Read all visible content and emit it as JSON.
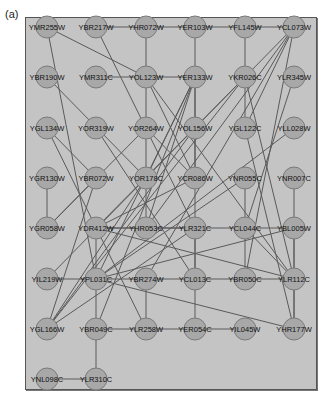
{
  "panel_label": "(a)",
  "colors": {
    "background": "#c4c4c4",
    "node_fill": "#a8a8a8",
    "edge": "#5a5a5a",
    "border": "#555555"
  },
  "grid": {
    "cols_x": [
      47,
      96,
      146,
      195,
      245,
      294
    ],
    "rows_y": [
      27,
      77,
      128,
      178,
      228,
      279,
      329,
      379
    ]
  },
  "nodes": [
    {
      "id": "YMR255W",
      "c": 0,
      "r": 0
    },
    {
      "id": "YBR217W",
      "c": 1,
      "r": 0
    },
    {
      "id": "YHR072W",
      "c": 2,
      "r": 0
    },
    {
      "id": "YER103W",
      "c": 3,
      "r": 0
    },
    {
      "id": "YFL145W",
      "c": 4,
      "r": 0
    },
    {
      "id": "YCL073W",
      "c": 5,
      "r": 0
    },
    {
      "id": "YBR190W",
      "c": 0,
      "r": 1
    },
    {
      "id": "YMR311C",
      "c": 1,
      "r": 1
    },
    {
      "id": "YOL123W",
      "c": 2,
      "r": 1
    },
    {
      "id": "YER133W",
      "c": 3,
      "r": 1
    },
    {
      "id": "YKR026C",
      "c": 4,
      "r": 1
    },
    {
      "id": "YLR345W",
      "c": 5,
      "r": 1
    },
    {
      "id": "YGL134W",
      "c": 0,
      "r": 2
    },
    {
      "id": "YOR319W",
      "c": 1,
      "r": 2
    },
    {
      "id": "YOR264W",
      "c": 2,
      "r": 2
    },
    {
      "id": "YOL156W",
      "c": 3,
      "r": 2
    },
    {
      "id": "YGL122C",
      "c": 4,
      "r": 2
    },
    {
      "id": "YLL028W",
      "c": 5,
      "r": 2
    },
    {
      "id": "YGR130W",
      "c": 0,
      "r": 3
    },
    {
      "id": "YBR072W",
      "c": 1,
      "r": 3
    },
    {
      "id": "YOR178C",
      "c": 2,
      "r": 3
    },
    {
      "id": "YCR086W",
      "c": 3,
      "r": 3
    },
    {
      "id": "YNR055C",
      "c": 4,
      "r": 3
    },
    {
      "id": "YNR007C",
      "c": 5,
      "r": 3
    },
    {
      "id": "YGR058W",
      "c": 0,
      "r": 4
    },
    {
      "id": "YDR412W",
      "c": 1,
      "r": 4
    },
    {
      "id": "YHR053C",
      "c": 2,
      "r": 4
    },
    {
      "id": "YLR321C",
      "c": 3,
      "r": 4
    },
    {
      "id": "YCL044C",
      "c": 4,
      "r": 4
    },
    {
      "id": "YBL005W",
      "c": 5,
      "r": 4
    },
    {
      "id": "YIL219W",
      "c": 0,
      "r": 5
    },
    {
      "id": "YPL031C",
      "c": 1,
      "r": 5
    },
    {
      "id": "YBR274W",
      "c": 2,
      "r": 5
    },
    {
      "id": "YCL013C",
      "c": 3,
      "r": 5
    },
    {
      "id": "YBR050C",
      "c": 4,
      "r": 5
    },
    {
      "id": "YLR112C",
      "c": 5,
      "r": 5
    },
    {
      "id": "YGL166W",
      "c": 0,
      "r": 6
    },
    {
      "id": "YBR049C",
      "c": 1,
      "r": 6
    },
    {
      "id": "YLR258W",
      "c": 2,
      "r": 6
    },
    {
      "id": "YER054C",
      "c": 3,
      "r": 6
    },
    {
      "id": "YIL045W",
      "c": 4,
      "r": 6
    },
    {
      "id": "YHR177W",
      "c": 5,
      "r": 6
    },
    {
      "id": "YNL098C",
      "c": 0,
      "r": 7
    },
    {
      "id": "YLR310C",
      "c": 1,
      "r": 7
    }
  ],
  "edges": [
    [
      "YBR217W",
      "YHR072W"
    ],
    [
      "YHR072W",
      "YER103W"
    ],
    [
      "YER103W",
      "YFL145W"
    ],
    [
      "YFL145W",
      "YCL073W"
    ],
    [
      "YMR311C",
      "YOL123W"
    ],
    [
      "YOL123W",
      "YER133W"
    ],
    [
      "YMR255W",
      "YOL123W"
    ],
    [
      "YMR255W",
      "YPL031C"
    ],
    [
      "YBR217W",
      "YLR321C"
    ],
    [
      "YHR072W",
      "YHR053C"
    ],
    [
      "YER103W",
      "YOL156W"
    ],
    [
      "YFL145W",
      "YGL122C"
    ],
    [
      "YCL073W",
      "YOL156W"
    ],
    [
      "YCL073W",
      "YHR053C"
    ],
    [
      "YCL073W",
      "YBR274W"
    ],
    [
      "YCL073W",
      "YGL122C"
    ],
    [
      "YCL073W",
      "YBR050C"
    ],
    [
      "YBR190W",
      "YOR178C"
    ],
    [
      "YOL123W",
      "YLR112C"
    ],
    [
      "YOL123W",
      "YCR086W"
    ],
    [
      "YER133W",
      "YOR178C"
    ],
    [
      "YER133W",
      "YPL031C"
    ],
    [
      "YER133W",
      "YBR049C"
    ],
    [
      "YER133W",
      "YHR053C"
    ],
    [
      "YER133W",
      "YCL013C"
    ],
    [
      "YKR026C",
      "YLR112C"
    ],
    [
      "YKR026C",
      "YDR412W"
    ],
    [
      "YKR026C",
      "YGL166W"
    ],
    [
      "YLR345W",
      "YCL044C"
    ],
    [
      "YGL134W",
      "YLR258W"
    ],
    [
      "YOR319W",
      "YCL013C"
    ],
    [
      "YOR264W",
      "YGR058W"
    ],
    [
      "YOR264W",
      "YCR086W"
    ],
    [
      "YOL156W",
      "YOL156W"
    ],
    [
      "YOL156W",
      "YCR086W"
    ],
    [
      "YOL156W",
      "YGL166W"
    ],
    [
      "YOL156W",
      "YIL219W"
    ],
    [
      "YGL122C",
      "YHR177W"
    ],
    [
      "YLL028W",
      "YPL031C"
    ],
    [
      "YNR007C",
      "YBL005W"
    ],
    [
      "YGR130W",
      "YGR058W"
    ],
    [
      "YBR072W",
      "YGL166W"
    ],
    [
      "YBR072W",
      "YGL134W"
    ],
    [
      "YOR178C",
      "YGL166W"
    ],
    [
      "YCR086W",
      "YDR412W"
    ],
    [
      "YNR055C",
      "YBR050C"
    ],
    [
      "YNR055C",
      "YPL031C"
    ],
    [
      "YGR058W",
      "YBR072W"
    ],
    [
      "YDR412W",
      "YHR053C"
    ],
    [
      "YDR412W",
      "YBL005W"
    ],
    [
      "YDR412W",
      "YLR112C"
    ],
    [
      "YDR412W",
      "YLR310C"
    ],
    [
      "YHR053C",
      "YLR321C"
    ],
    [
      "YLR321C",
      "YCL013C"
    ],
    [
      "YLR321C",
      "YGL166W"
    ],
    [
      "YCL044C",
      "YLR112C"
    ],
    [
      "YBL005W",
      "YPL031C"
    ],
    [
      "YBL005W",
      "YLR112C"
    ],
    [
      "YBL005W",
      "YHR177W"
    ],
    [
      "YIL219W",
      "YPL031C"
    ],
    [
      "YPL031C",
      "YBR274W"
    ],
    [
      "YBR274W",
      "YCL013C"
    ],
    [
      "YCL013C",
      "YLR112C"
    ],
    [
      "YCL013C",
      "YER054C"
    ],
    [
      "YPL031C",
      "YHR177W"
    ],
    [
      "YBR274W",
      "YLR258W"
    ],
    [
      "YLR112C",
      "YHR177W"
    ],
    [
      "YBR049C",
      "YLR258W"
    ],
    [
      "YLR258W",
      "YER054C"
    ],
    [
      "YER054C",
      "YIL045W"
    ],
    [
      "YNL098C",
      "YLR310C"
    ]
  ]
}
